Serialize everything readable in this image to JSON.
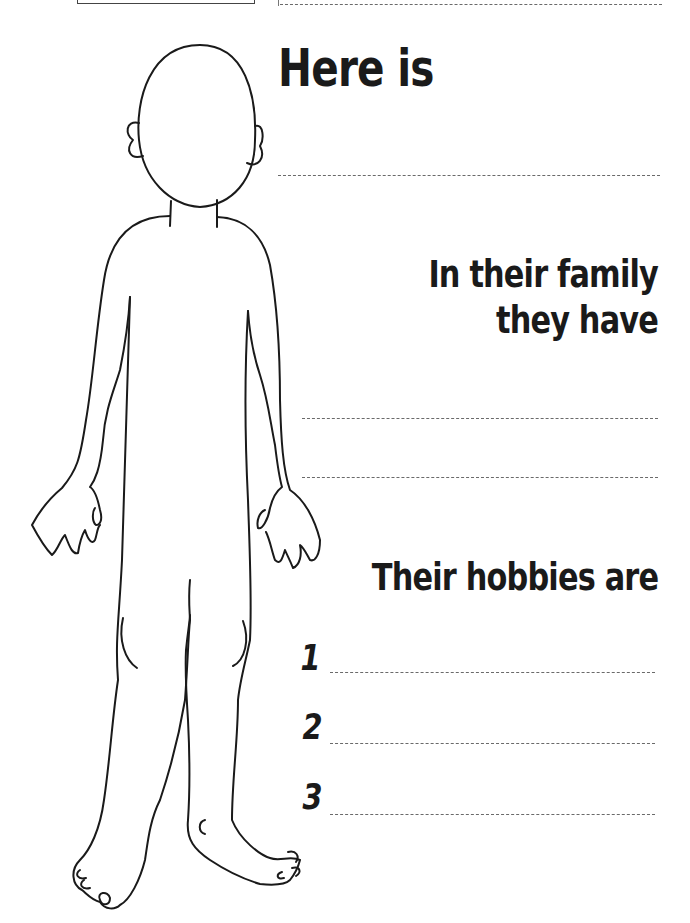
{
  "worksheet": {
    "top_box_label": "",
    "name_prompt": "Here is",
    "family_prompt_line1": "In their family",
    "family_prompt_line2": "they have",
    "hobbies_prompt": "Their hobbies are",
    "hobby_numbers": [
      "1",
      "2",
      "3"
    ],
    "name_answer": "",
    "family_answers": [
      "",
      ""
    ],
    "hobby_answers": [
      "",
      "",
      ""
    ]
  },
  "illustration": {
    "subject": "blank-body-outline",
    "stroke_color": "#1a1a1a"
  }
}
